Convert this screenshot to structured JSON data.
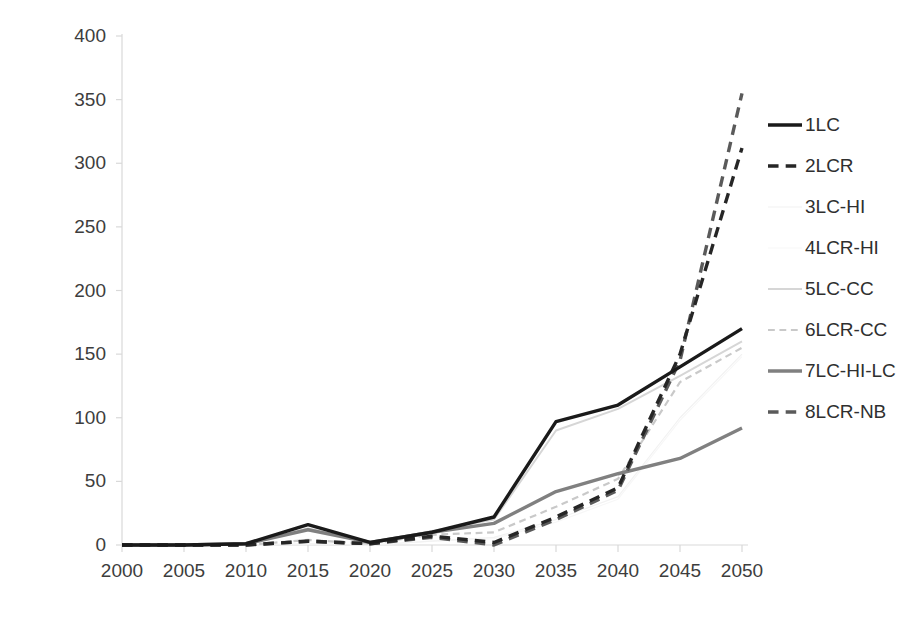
{
  "chart_data": {
    "type": "line",
    "title": "",
    "xlabel": "",
    "ylabel": "(2000)£/tCO2",
    "x": [
      2000,
      2005,
      2010,
      2015,
      2020,
      2025,
      2030,
      2035,
      2040,
      2045,
      2050
    ],
    "categories": [
      "2000",
      "2005",
      "2010",
      "2015",
      "2020",
      "2025",
      "2030",
      "2035",
      "2040",
      "2045",
      "2050"
    ],
    "xlim": [
      2000,
      2050
    ],
    "ylim": [
      0,
      400
    ],
    "yticks": [
      0,
      50,
      100,
      150,
      200,
      250,
      300,
      350,
      400
    ],
    "grid": false,
    "legend_position": "right",
    "series": [
      {
        "name": "1LC",
        "color": "#1a1a1a",
        "style": "solid",
        "width": 3.4,
        "values": [
          0,
          0,
          1,
          16,
          2,
          10,
          22,
          97,
          110,
          140,
          170
        ]
      },
      {
        "name": "2LCR",
        "color": "#262626",
        "style": "dashed",
        "width": 3.4,
        "values": [
          0,
          0,
          0,
          3,
          1,
          7,
          2,
          22,
          45,
          150,
          312
        ]
      },
      {
        "name": "3LC-HI",
        "color": "#f2f2f2",
        "style": "solid",
        "width": 1.2,
        "values": [
          0,
          0,
          0,
          1,
          0,
          3,
          6,
          20,
          38,
          100,
          150
        ]
      },
      {
        "name": "4LCR-HI",
        "color": "#f7f7f7",
        "style": "solid",
        "width": 1.2,
        "values": [
          0,
          0,
          0,
          1,
          0,
          3,
          5,
          18,
          36,
          98,
          148
        ]
      },
      {
        "name": "5LC-CC",
        "color": "#d6d6d6",
        "style": "solid",
        "width": 2.0,
        "values": [
          0,
          0,
          1,
          13,
          2,
          11,
          20,
          90,
          107,
          133,
          160
        ]
      },
      {
        "name": "6LCR-CC",
        "color": "#c9c9c9",
        "style": "dashed",
        "width": 2.2,
        "values": [
          0,
          0,
          0,
          4,
          1,
          8,
          10,
          30,
          52,
          128,
          155
        ]
      },
      {
        "name": "7LC-HI-LC",
        "color": "#808080",
        "style": "solid",
        "width": 3.4,
        "values": [
          0,
          0,
          1,
          12,
          2,
          10,
          17,
          42,
          56,
          68,
          92
        ]
      },
      {
        "name": "8LCR-NB",
        "color": "#5a5a5a",
        "style": "dashed",
        "width": 3.4,
        "values": [
          0,
          0,
          0,
          3,
          1,
          6,
          0,
          20,
          43,
          145,
          355
        ]
      }
    ]
  },
  "legend": {
    "items": [
      {
        "label": "1LC"
      },
      {
        "label": "2LCR"
      },
      {
        "label": "3LC-HI"
      },
      {
        "label": "4LCR-HI"
      },
      {
        "label": "5LC-CC"
      },
      {
        "label": "6LCR-CC"
      },
      {
        "label": "7LC-HI-LC"
      },
      {
        "label": "8LCR-NB"
      }
    ]
  }
}
